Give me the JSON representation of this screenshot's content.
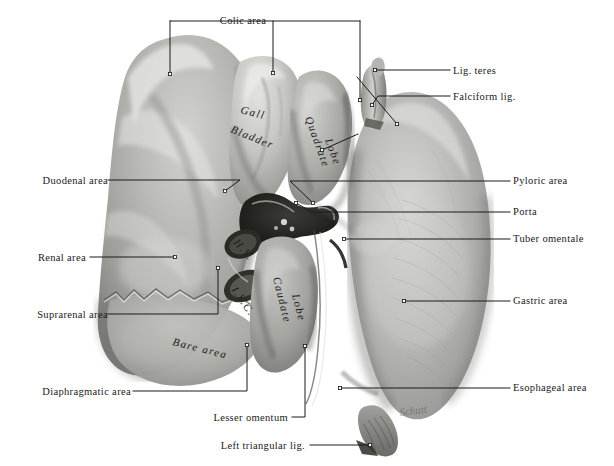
{
  "figure": {
    "background_color": "#ffffff",
    "ink_color": "#1a1a1a",
    "signature": "Schutt"
  },
  "labels_top": [
    {
      "text": "Colic area",
      "x": 243,
      "y": 16,
      "align": "center"
    }
  ],
  "labels_left": [
    {
      "text": "Duodenal area",
      "x": 108,
      "y": 176
    },
    {
      "text": "Renal area",
      "x": 86,
      "y": 253
    },
    {
      "text": "Suprarenal area",
      "x": 108,
      "y": 310
    },
    {
      "text": "Diaphragmatic area",
      "x": 131,
      "y": 387
    }
  ],
  "labels_right": [
    {
      "text": "Lig. teres",
      "x": 453,
      "y": 66
    },
    {
      "text": "Falciform lig.",
      "x": 453,
      "y": 92
    },
    {
      "text": "Pyloric area",
      "x": 513,
      "y": 176
    },
    {
      "text": "Porta",
      "x": 513,
      "y": 207
    },
    {
      "text": "Tuber omentale",
      "x": 513,
      "y": 234
    },
    {
      "text": "Gastric area",
      "x": 513,
      "y": 296
    },
    {
      "text": "Esophageal area",
      "x": 513,
      "y": 383
    }
  ],
  "labels_bottom": [
    {
      "text": "Lesser omentum",
      "x": 288,
      "y": 413,
      "align": "right"
    },
    {
      "text": "Left triangular lig.",
      "x": 305,
      "y": 441,
      "align": "right"
    }
  ],
  "handwritten": [
    {
      "text": "Gall",
      "x": 240,
      "y": 113,
      "rotate": 14
    },
    {
      "text": "Bladder",
      "x": 230,
      "y": 132,
      "rotate": 22
    },
    {
      "text": "Quadrate",
      "x": 305,
      "y": 118,
      "rotate": 70
    },
    {
      "text": "Lobe",
      "x": 325,
      "y": 140,
      "rotate": 70
    },
    {
      "text": "Caudate",
      "x": 273,
      "y": 278,
      "rotate": 76
    },
    {
      "text": "Lobe",
      "x": 292,
      "y": 295,
      "rotate": 76
    },
    {
      "text": "Bare area",
      "x": 172,
      "y": 345,
      "rotate": 14
    },
    {
      "text": "I.V.C.",
      "x": 231,
      "y": 290,
      "rotate": 55
    },
    {
      "text": "H.V.",
      "x": 233,
      "y": 243,
      "rotate": 48
    }
  ],
  "leader_lines": {
    "colic_bracket": {
      "bar_y": 21,
      "left_x": 170,
      "right_x": 360,
      "drops": [
        {
          "x": 170,
          "y2": 74
        },
        {
          "x": 273,
          "y2": 73
        },
        {
          "x": 360,
          "y2": 100
        }
      ]
    },
    "lines": [
      {
        "name": "duodenal-area",
        "pts": "108,180 240,180 225,191"
      },
      {
        "name": "renal-area",
        "pts": "90,257 175,257"
      },
      {
        "name": "suprarenal-area",
        "pts": "108,314 218,314 218,268"
      },
      {
        "name": "diaphragmatic-area",
        "pts": "133,391 247,391 247,345"
      },
      {
        "name": "lesser-omentum",
        "pts": "292,417 305,417 305,346"
      },
      {
        "name": "left-triangular",
        "pts": "310,445 370,445"
      },
      {
        "name": "lig-teres",
        "pts": "450,70 375,70"
      },
      {
        "name": "falciform-lig",
        "pts": "450,96 378,96 372,105"
      },
      {
        "name": "falciform-leader",
        "pts": "357,77 397,124"
      },
      {
        "name": "pyloric-area",
        "pts": "510,181 290,181 313,203"
      },
      {
        "name": "porta",
        "pts": "510,212 312,212 296,203"
      },
      {
        "name": "tuber-omentale",
        "pts": "510,239 344,239"
      },
      {
        "name": "gastric-area",
        "pts": "510,301 404,301"
      },
      {
        "name": "esophageal-area",
        "pts": "510,388 340,388"
      },
      {
        "name": "quadrate-lobe-dot",
        "pts": "358,134 322,150"
      }
    ]
  }
}
